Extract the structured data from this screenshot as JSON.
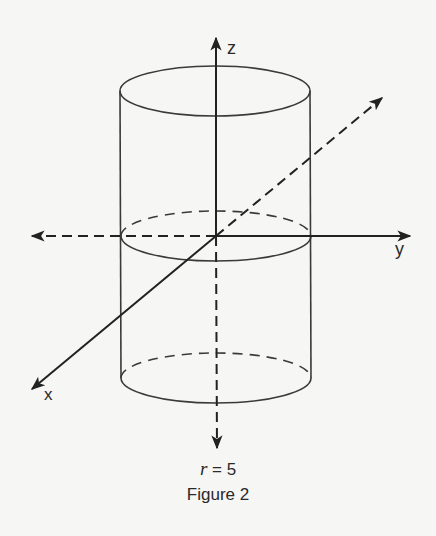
{
  "figure": {
    "caption_equation": "r = 5",
    "caption_equation_var": "r",
    "caption_equation_rest": " = 5",
    "caption_title": "Figure 2",
    "axes": {
      "x_label": "x",
      "y_label": "y",
      "z_label": "z"
    },
    "shape": "cylinder",
    "radius": 5,
    "colors": {
      "line": "#2b2b2b",
      "background": "#f6f6f4"
    }
  }
}
